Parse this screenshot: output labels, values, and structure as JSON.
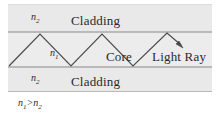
{
  "figure": {
    "layers": {
      "cladding_top": {
        "index_label": "n2",
        "index_sub": "2",
        "name": "Cladding"
      },
      "core": {
        "index_label": "n1",
        "index_sub": "1",
        "name": "Core"
      },
      "cladding_bottom": {
        "index_label": "n2",
        "index_sub": "2",
        "name": "Cladding"
      }
    },
    "ray": {
      "label": "Light Ray",
      "arrowhead": "arrow-down-right"
    },
    "condition": {
      "left": "n",
      "left_sub": "1",
      "operator": ">",
      "right": "n",
      "right_sub": "2"
    },
    "colors": {
      "band_fill": "#e9e9e9",
      "core_fill": "#ececec",
      "band_border": "#b9b9b9",
      "ray_stroke": "#4a4a4a",
      "text": "#2a2a2a",
      "page_background": "#ffffff"
    }
  }
}
